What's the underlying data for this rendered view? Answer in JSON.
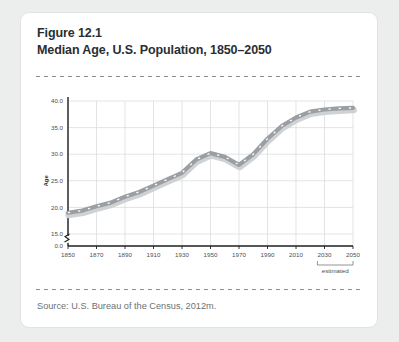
{
  "figure": {
    "number_label": "Figure 12.1",
    "title": "Median Age, U.S. Population, 1850–2050",
    "source": "Source: U.S. Bureau of the Census, 2012m."
  },
  "chart_data": {
    "type": "line",
    "title": "Median Age, U.S. Population, 1850–2050",
    "xlabel": "",
    "ylabel": "Age",
    "xlim": [
      1850,
      2050
    ],
    "ylim": [
      15.0,
      40.0
    ],
    "y_axis_break": true,
    "y_zero_tick": "0.0",
    "grid": true,
    "legend": false,
    "line_color": "#9b9fa3",
    "line_style": "thick-gray-with-white-dashes",
    "annotation": "estimated",
    "annotation_range": [
      2025,
      2050
    ],
    "ytick_labels": [
      "0.0",
      "15.0",
      "20.0",
      "25.0",
      "30.0",
      "35.0",
      "40.0"
    ],
    "ytick_values": [
      15.0,
      20.0,
      25.0,
      30.0,
      35.0,
      40.0
    ],
    "xtick_labels": [
      "1850",
      "1870",
      "1890",
      "1910",
      "1930",
      "1950",
      "1970",
      "1990",
      "2010",
      "2030",
      "2050"
    ],
    "xtick_values": [
      1850,
      1870,
      1890,
      1910,
      1930,
      1950,
      1970,
      1990,
      2010,
      2030,
      2050
    ],
    "x": [
      1850,
      1860,
      1870,
      1880,
      1890,
      1900,
      1910,
      1920,
      1930,
      1940,
      1950,
      1960,
      1970,
      1980,
      1990,
      2000,
      2010,
      2020,
      2030,
      2040,
      2050
    ],
    "values": [
      19.0,
      19.4,
      20.2,
      20.9,
      22.0,
      22.9,
      24.1,
      25.3,
      26.5,
      29.0,
      30.2,
      29.5,
      28.0,
      30.0,
      32.9,
      35.3,
      36.9,
      38.0,
      38.4,
      38.6,
      38.7
    ],
    "series": [
      {
        "name": "Median age",
        "values": [
          19.0,
          19.4,
          20.2,
          20.9,
          22.0,
          22.9,
          24.1,
          25.3,
          26.5,
          29.0,
          30.2,
          29.5,
          28.0,
          30.0,
          32.9,
          35.3,
          36.9,
          38.0,
          38.4,
          38.6,
          38.7
        ]
      }
    ]
  }
}
